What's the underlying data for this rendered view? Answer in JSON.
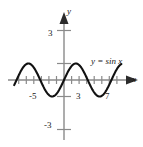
{
  "chart_data": {
    "type": "line",
    "title": "",
    "subtitle": "",
    "xlabel": "x",
    "ylabel": "y",
    "xlim": [
      -6.8,
      8.2
    ],
    "ylim": [
      -3.6,
      3.6
    ],
    "grid": false,
    "legend_position": "inline-right",
    "x_ticks": [
      -6,
      -5,
      -4,
      -3,
      -2,
      -1,
      1,
      2,
      3,
      4,
      5,
      6,
      7
    ],
    "x_tick_labels": [
      "",
      "-5",
      "",
      "",
      "",
      "",
      "",
      "",
      "3",
      "",
      "",
      "",
      "7"
    ],
    "y_ticks": [
      -3,
      -1,
      1,
      3
    ],
    "y_tick_labels": [
      "-3",
      "",
      "",
      "3"
    ],
    "annotations": [
      {
        "text": "y = sin x",
        "x": 5.2,
        "y": 1.7
      }
    ],
    "series": [
      {
        "name": "y = sin x",
        "color": "#111111",
        "function": "sin(x)",
        "amplitude": 1,
        "period": 6.283185307179586,
        "x_range": [
          -6.6,
          7.6
        ],
        "x": [
          -6.6,
          -6.2,
          -5.8,
          -5.4,
          -5.0,
          -4.6,
          -4.2,
          -3.8,
          -3.4,
          -3.0,
          -2.6,
          -2.2,
          -1.8,
          -1.4,
          -1.0,
          -0.6,
          -0.2,
          0.2,
          0.6,
          1.0,
          1.4,
          1.8,
          2.2,
          2.6,
          3.0,
          3.4,
          3.8,
          4.2,
          4.6,
          5.0,
          5.4,
          5.8,
          6.2,
          6.6,
          7.0,
          7.4,
          7.6
        ],
        "y": [
          -0.31,
          0.08,
          0.46,
          0.77,
          0.96,
          0.99,
          0.87,
          0.61,
          0.26,
          -0.14,
          -0.52,
          -0.81,
          -0.97,
          -0.99,
          -0.84,
          -0.56,
          -0.2,
          0.2,
          0.56,
          0.84,
          0.99,
          0.97,
          0.81,
          0.52,
          0.14,
          -0.26,
          -0.61,
          -0.87,
          -0.99,
          -0.96,
          -0.77,
          -0.46,
          -0.08,
          0.31,
          0.66,
          0.89,
          0.95
        ]
      }
    ]
  },
  "labels": {
    "x_neg5": "-5",
    "x_3": "3",
    "x_7": "7",
    "y_3": "3",
    "y_neg3": "-3",
    "axis_y": "y",
    "axis_x": "x",
    "curve": "y = sin x"
  },
  "colors": {
    "curve": "#111111",
    "axis": "#8a8a8a",
    "tick": "#8a8a8a",
    "text": "#1a1a1a",
    "background": "#ffffff"
  }
}
